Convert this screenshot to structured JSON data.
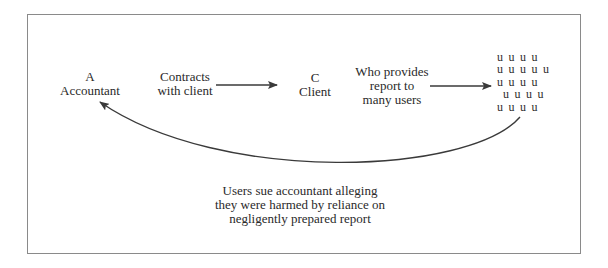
{
  "diagram": {
    "nodes": {
      "accountant": {
        "letter": "A",
        "name": "Accountant"
      },
      "client": {
        "letter": "C",
        "name": "Client"
      }
    },
    "edges": {
      "contracts": {
        "lines": [
          "Contracts",
          "with client"
        ]
      },
      "provides": {
        "lines": [
          "Who provides",
          "report to",
          "many users"
        ]
      },
      "lawsuit": {
        "lines": [
          "Users sue accountant alleging",
          "they were harmed by reliance on",
          "negligently prepared report"
        ]
      }
    },
    "users": {
      "glyph": "u",
      "rows": [
        {
          "offset": 0,
          "count": 4
        },
        {
          "offset": 0,
          "count": 5
        },
        {
          "offset": 0,
          "count": 4
        },
        {
          "offset": 6,
          "count": 4
        },
        {
          "offset": 0,
          "count": 4
        }
      ]
    },
    "colors": {
      "text": "#2a2a2a",
      "arrow": "#3a3a3a",
      "frame": "#8a8a8a"
    }
  }
}
